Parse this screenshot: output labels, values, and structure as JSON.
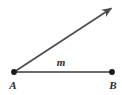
{
  "figure": {
    "width": 122,
    "height": 95,
    "background_color": "#ffffff"
  },
  "labels": {
    "vertex_a": "A",
    "vertex_b": "B",
    "segment_measure": "m"
  },
  "colors": {
    "point_fill": "#1a1a1a",
    "segment_stroke": "#6b6b6b",
    "ray_stroke": "#4d4d4d",
    "label_text": "#2b2b2b"
  },
  "geometry": {
    "point_a": {
      "x": 14,
      "y": 72,
      "radius": 2.8
    },
    "point_b": {
      "x": 112,
      "y": 72,
      "radius": 2.8
    },
    "segment_ab": {
      "x1": 14,
      "y1": 72,
      "x2": 112,
      "y2": 72,
      "stroke_width": 2
    },
    "ray_from_a": {
      "x1": 14,
      "y1": 72,
      "x2": 116,
      "y2": 5,
      "stroke_width": 1.6
    },
    "arrow_tip": {
      "x": 117,
      "y": 4
    },
    "label_a_pos": {
      "x": 16,
      "y": 88
    },
    "label_b_pos": {
      "x": 112,
      "y": 88
    },
    "label_m_pos": {
      "x": 61,
      "y": 66
    }
  }
}
